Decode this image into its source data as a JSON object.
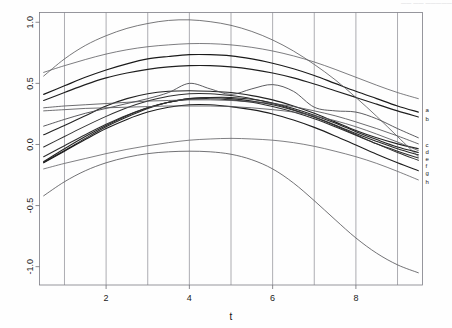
{
  "header": {
    "faint_text": "—— —— —————"
  },
  "chart_data": {
    "type": "line",
    "title": "",
    "subtitle": "",
    "xlabel": "t",
    "ylabel": "",
    "xlim": [
      0.4,
      9.6
    ],
    "ylim": [
      -1.15,
      1.08
    ],
    "xticks": [
      2,
      4,
      6,
      8
    ],
    "xtick_labels": [
      "2",
      "4",
      "6",
      "8"
    ],
    "yticks": [
      -1.0,
      -0.5,
      0.0,
      0.5,
      1.0
    ],
    "ytick_labels": [
      "-1.0",
      "-0.5",
      "0.0",
      "0.5",
      "1.0"
    ],
    "grid": true,
    "grid_axis": "x",
    "grid_x": [
      1,
      2,
      3,
      4,
      5,
      6,
      7,
      8,
      9
    ],
    "legend": "right-endpoint-labels",
    "x": [
      0.5,
      1.0,
      1.5,
      2.0,
      2.5,
      3.0,
      3.5,
      4.0,
      4.5,
      5.0,
      5.5,
      6.0,
      6.5,
      7.0,
      7.5,
      8.0,
      8.5,
      9.0,
      9.5
    ],
    "series": [
      {
        "name": "a",
        "label": "a",
        "color": "#1a1a1a",
        "width": 1.15,
        "values": [
          0.41,
          0.48,
          0.55,
          0.61,
          0.66,
          0.7,
          0.72,
          0.735,
          0.735,
          0.725,
          0.7,
          0.665,
          0.62,
          0.565,
          0.5,
          0.435,
          0.375,
          0.315,
          0.265
        ]
      },
      {
        "name": "b",
        "label": "b",
        "color": "#1f1f1f",
        "width": 1.15,
        "values": [
          0.36,
          0.425,
          0.49,
          0.545,
          0.585,
          0.615,
          0.635,
          0.645,
          0.645,
          0.635,
          0.615,
          0.585,
          0.545,
          0.495,
          0.44,
          0.385,
          0.33,
          0.275,
          0.225
        ]
      },
      {
        "name": "c",
        "label": "c",
        "color": "#242424",
        "width": 1.1,
        "values": [
          0.08,
          0.155,
          0.235,
          0.315,
          0.375,
          0.415,
          0.435,
          0.44,
          0.435,
          0.425,
          0.4,
          0.365,
          0.315,
          0.255,
          0.185,
          0.115,
          0.055,
          0.005,
          -0.035
        ]
      },
      {
        "name": "d",
        "label": "d",
        "color": "#262626",
        "width": 1.1,
        "values": [
          -0.14,
          -0.035,
          0.065,
          0.155,
          0.235,
          0.3,
          0.345,
          0.375,
          0.385,
          0.385,
          0.37,
          0.34,
          0.295,
          0.24,
          0.175,
          0.105,
          0.04,
          -0.02,
          -0.065
        ]
      },
      {
        "name": "e",
        "label": "e",
        "color": "#2a2a2a",
        "width": 1.1,
        "values": [
          -0.145,
          -0.05,
          0.05,
          0.145,
          0.225,
          0.295,
          0.345,
          0.375,
          0.385,
          0.375,
          0.355,
          0.325,
          0.28,
          0.225,
          0.16,
          0.09,
          0.025,
          -0.035,
          -0.085
        ]
      },
      {
        "name": "f",
        "label": "f",
        "color": "#2e2e2e",
        "width": 1.05,
        "values": [
          -0.1,
          -0.01,
          0.08,
          0.165,
          0.24,
          0.3,
          0.345,
          0.37,
          0.375,
          0.365,
          0.345,
          0.31,
          0.265,
          0.21,
          0.145,
          0.075,
          0.005,
          -0.055,
          -0.11
        ]
      },
      {
        "name": "g",
        "label": "g",
        "color": "#303030",
        "width": 1.05,
        "values": [
          -0.02,
          0.065,
          0.15,
          0.23,
          0.3,
          0.355,
          0.395,
          0.415,
          0.415,
          0.4,
          0.375,
          0.335,
          0.285,
          0.225,
          0.155,
          0.08,
          0.005,
          -0.065,
          -0.13
        ]
      },
      {
        "name": "h",
        "label": "h",
        "color": "#1d1d1d",
        "width": 1.1,
        "values": [
          -0.15,
          -0.055,
          0.04,
          0.13,
          0.205,
          0.265,
          0.305,
          0.325,
          0.325,
          0.31,
          0.285,
          0.25,
          0.2,
          0.14,
          0.07,
          -0.005,
          -0.08,
          -0.15,
          -0.215
        ]
      },
      {
        "name": "series-9",
        "label": "",
        "color": "#555558",
        "width": 0.8,
        "values": [
          0.56,
          0.7,
          0.81,
          0.89,
          0.95,
          0.99,
          1.015,
          1.02,
          1.005,
          0.975,
          0.925,
          0.855,
          0.765,
          0.655,
          0.53,
          0.385,
          0.23,
          0.065,
          -0.1
        ]
      },
      {
        "name": "series-10",
        "label": "",
        "color": "#5c5c60",
        "width": 0.8,
        "values": [
          0.59,
          0.645,
          0.695,
          0.74,
          0.775,
          0.8,
          0.815,
          0.825,
          0.825,
          0.815,
          0.795,
          0.765,
          0.725,
          0.675,
          0.615,
          0.55,
          0.485,
          0.425,
          0.375
        ]
      },
      {
        "name": "series-11",
        "label": "",
        "color": "#4a4a4e",
        "width": 0.9,
        "values": [
          0.15,
          0.205,
          0.255,
          0.295,
          0.335,
          0.375,
          0.425,
          0.5,
          0.455,
          0.41,
          0.455,
          0.49,
          0.435,
          0.305,
          0.275,
          0.265,
          0.21,
          0.13,
          0.055
        ]
      },
      {
        "name": "series-12",
        "label": "",
        "color": "#515155",
        "width": 0.85,
        "values": [
          0.3,
          0.315,
          0.325,
          0.335,
          0.345,
          0.355,
          0.36,
          0.365,
          0.365,
          0.36,
          0.35,
          0.335,
          0.31,
          0.275,
          0.235,
          0.185,
          0.13,
          0.07,
          0.005
        ]
      },
      {
        "name": "series-13",
        "label": "",
        "color": "#56565a",
        "width": 0.85,
        "values": [
          0.275,
          0.285,
          0.295,
          0.3,
          0.305,
          0.31,
          0.315,
          0.315,
          0.315,
          0.31,
          0.3,
          0.285,
          0.265,
          0.235,
          0.195,
          0.145,
          0.085,
          0.02,
          -0.05
        ]
      },
      {
        "name": "series-14",
        "label": "",
        "color": "#5f5f63",
        "width": 0.8,
        "values": [
          -0.2,
          -0.155,
          -0.115,
          -0.075,
          -0.04,
          -0.01,
          0.015,
          0.035,
          0.045,
          0.05,
          0.045,
          0.035,
          0.015,
          -0.015,
          -0.055,
          -0.1,
          -0.155,
          -0.22,
          -0.29
        ]
      },
      {
        "name": "series-15",
        "label": "",
        "color": "#58585c",
        "width": 0.85,
        "values": [
          -0.42,
          -0.305,
          -0.215,
          -0.15,
          -0.105,
          -0.075,
          -0.06,
          -0.055,
          -0.06,
          -0.08,
          -0.125,
          -0.2,
          -0.315,
          -0.46,
          -0.615,
          -0.765,
          -0.89,
          -0.985,
          -1.05
        ]
      }
    ]
  }
}
